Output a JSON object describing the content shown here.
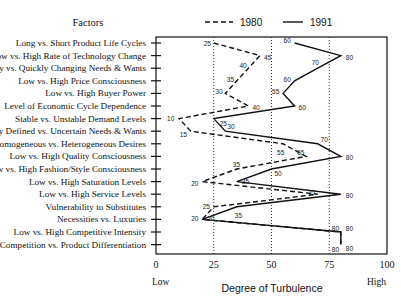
{
  "chart_data": {
    "type": "line",
    "orientation": "horizontal-profile",
    "title": "",
    "categories_header": "Factors",
    "categories": [
      "Long vs. Short Product Life Cycles",
      "Low vs. High Rate of Technology Change",
      "Slowly vs. Quickly Changing Needs & Wants",
      "Low vs. High Price Consciousness",
      "Low vs. High Buyer Power",
      "Level of Economic Cycle Dependence",
      "Stable vs. Unstable Demand Levels",
      "Easily Defined vs. Uncertain Needs & Wants",
      "Homogeneous vs. Heterogeneous Desires",
      "Low vs. High Quality Consciousness",
      "Low vs. High Fashion/Style Consciousness",
      "Low vs. High Saturation Levels",
      "Low vs. High Service Levels",
      "Vulnerability to Substitutes",
      "Necessities vs. Luxuries",
      "Low vs. High Competitive Intensity",
      "Price Competition vs. Product Differentiation"
    ],
    "series": [
      {
        "name": "1980",
        "style": "dashed",
        "values": [
          25,
          45,
          40,
          35,
          30,
          40,
          10,
          15,
          55,
          65,
          35,
          20,
          70,
          25,
          20,
          80,
          80
        ]
      },
      {
        "name": "1991",
        "style": "solid",
        "values": [
          60,
          80,
          70,
          60,
          55,
          60,
          25,
          30,
          70,
          80,
          50,
          35,
          80,
          35,
          20,
          80,
          80
        ]
      }
    ],
    "xlabel": "Degree of Turbulence",
    "x_low_label": "Low",
    "x_high_label": "High",
    "xlim": [
      0,
      100
    ],
    "xticks": [
      "0",
      "25",
      "50",
      "75",
      "100"
    ],
    "gridlines": [
      25,
      50,
      75
    ],
    "grid": "vertical dotted",
    "legend_position": "top",
    "colors": {
      "line": "#111111",
      "grid": "#333333"
    }
  }
}
